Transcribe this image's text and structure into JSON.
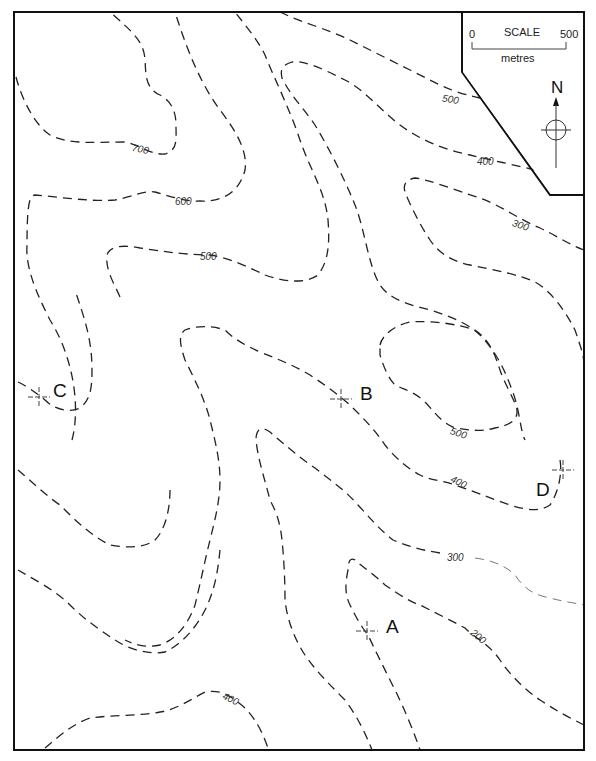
{
  "map": {
    "type": "topographic contour map",
    "contour_interval": 100,
    "contour_values_labeled": [
      "700",
      "600",
      "500",
      "500",
      "400",
      "300",
      "500",
      "400",
      "300",
      "200",
      "400"
    ],
    "labels": {
      "c700": "700",
      "c600": "600",
      "c500_left": "500",
      "c500_top": "500",
      "c400_top": "400",
      "c300_top": "300",
      "c500_hill": "500",
      "c400_mid": "400",
      "c300_mid": "300",
      "c200": "200",
      "c400_bottom": "400"
    },
    "points": {
      "A": "A",
      "B": "B",
      "C": "C",
      "D": "D"
    }
  },
  "scale": {
    "title": "SCALE",
    "start": "0",
    "end": "500",
    "unit": "metres"
  },
  "north_arrow": {
    "label": "N"
  },
  "colors": {
    "line": "#222222",
    "border": "#111111",
    "background": "#ffffff"
  }
}
